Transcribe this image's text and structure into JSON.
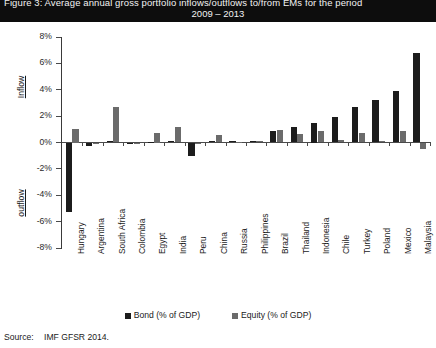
{
  "title": {
    "line1": "Figure 3:  Average annual gross portfolio inflows/outflows to/from EMs for the period",
    "line2": "2009 – 2013"
  },
  "source": {
    "label": "Source:",
    "text": "IMF GFSR 2014."
  },
  "axis_direction": {
    "positive": "Inflow",
    "negative": "outflow"
  },
  "legend": {
    "items": [
      {
        "label": "Bond (% of GDP)",
        "color": "#1c1c1c",
        "key": "bond"
      },
      {
        "label": "Equity (% of GDP)",
        "color": "#6b6b6b",
        "key": "equity"
      }
    ]
  },
  "chart_data": {
    "type": "bar",
    "title": "Figure 3:  Average annual gross portfolio inflows/outflows to/from EMs for the period 2009 – 2013",
    "xlabel": "",
    "ylabel": "% of GDP",
    "ylim": [
      -8,
      8
    ],
    "ytick_values": [
      8,
      6,
      4,
      2,
      0,
      -2,
      -4,
      -6,
      -8
    ],
    "ytick_labels": [
      "8%",
      "6%",
      "4%",
      "2%",
      "0%",
      "-2%",
      "-4%",
      "-6%",
      "-8%"
    ],
    "grid": false,
    "legend_position": "bottom",
    "categories": [
      "Hungary",
      "Argentina",
      "South Africa",
      "Colombia",
      "Egypt",
      "India",
      "Peru",
      "China",
      "Russia",
      "Philippines",
      "Brazil",
      "Thailand",
      "Indonesia",
      "Chile",
      "Turkey",
      "Poland",
      "Mexico",
      "Malaysia"
    ],
    "series": [
      {
        "name": "Bond (% of GDP)",
        "color": "#1c1c1c",
        "values": [
          -5.3,
          -0.3,
          0.1,
          -0.15,
          0.05,
          0.1,
          -1.0,
          0.1,
          0.1,
          0.15,
          0.85,
          1.15,
          1.5,
          1.9,
          2.7,
          3.2,
          3.9,
          6.8
        ]
      },
      {
        "name": "Equity (% of GDP)",
        "color": "#6b6b6b",
        "values": [
          1.0,
          0.0,
          2.7,
          0.0,
          0.75,
          1.15,
          0.0,
          0.55,
          0.05,
          0.1,
          0.95,
          0.65,
          0.85,
          0.2,
          0.7,
          0.1,
          0.9,
          -0.5
        ]
      }
    ]
  }
}
